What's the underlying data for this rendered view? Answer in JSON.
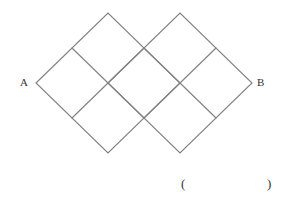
{
  "labels": {
    "start": "A",
    "end": "B"
  },
  "answer_blank": {
    "open": "(",
    "close": ")"
  },
  "colors": {
    "line": "#808080",
    "text": "#333333",
    "background": "#ffffff"
  },
  "figure": {
    "vertices": {
      "A": [
        36,
        83
      ],
      "top_left": [
        108,
        13
      ],
      "top_right": [
        180,
        13
      ],
      "B": [
        252,
        83
      ],
      "bottom_left": [
        108,
        153
      ],
      "bottom_right": [
        180,
        153
      ]
    },
    "cell_size_px": 36
  }
}
